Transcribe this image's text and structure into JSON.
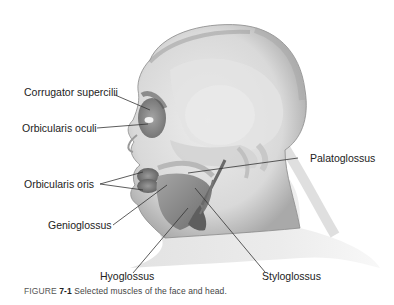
{
  "figure": {
    "caption_prefix": "FIGURE",
    "caption_number": "7-1",
    "caption_text": "Selected muscles of the face and head."
  },
  "labels": [
    {
      "id": "corrugator",
      "text": "Corrugator supercilii"
    },
    {
      "id": "orbicularis_oculi",
      "text": "Orbicularis oculi"
    },
    {
      "id": "palatoglossus",
      "text": "Palatoglossus"
    },
    {
      "id": "orbicularis_oris",
      "text": "Orbicularis oris"
    },
    {
      "id": "genioglossus",
      "text": "Genioglossus"
    },
    {
      "id": "hyoglossus",
      "text": "Hyoglossus"
    },
    {
      "id": "styloglossus",
      "text": "Styloglossus"
    }
  ],
  "colors": {
    "background": "#ffffff",
    "skin_light": "#e6e6e6",
    "skin_mid": "#c8c8c8",
    "muscle_dark": "#6e6e6e",
    "leader_line": "#333333"
  }
}
